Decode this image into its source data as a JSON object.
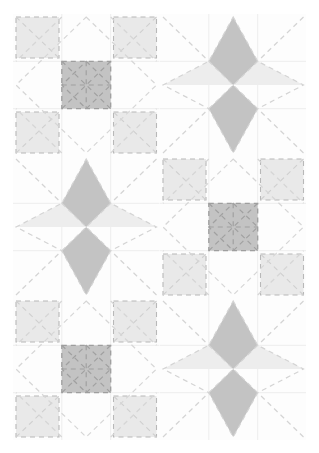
{
  "artwork": {
    "title": "Patchwork Quilt Layout",
    "type": "quilt-pattern",
    "canvas": {
      "width": 319,
      "height": 453
    },
    "surface": {
      "x": 13,
      "y": 14,
      "width": 293,
      "height": 426
    },
    "grid": {
      "columns": 2,
      "rows": 3,
      "block_width": 146.5,
      "block_height": 142
    }
  },
  "palette": {
    "background": "#ffffff",
    "block_background": "#fdfdfd",
    "medium_gray": "#c3c3c3",
    "light_gray": "#ebebeb",
    "pale_gray": "#f0f0f0",
    "seam_line": "#e3e3e3",
    "quilting_stitch": "#c9c9c9",
    "stitch_dark": "#b0b0b0",
    "patch_outline": "#b8b8b8"
  },
  "blocks": [
    {
      "index": 0,
      "name": "square-in-square-block",
      "row": 0,
      "col": 0,
      "pattern": "square-in-square",
      "center_fill": "#c3c3c3",
      "corner_fill": "#e9e9e9"
    },
    {
      "index": 1,
      "name": "four-point-star-block",
      "row": 0,
      "col": 1,
      "pattern": "four-point-star",
      "point_fill": "#c3c3c3",
      "wing_fill": "#ededed"
    },
    {
      "index": 2,
      "name": "four-point-star-block",
      "row": 1,
      "col": 0,
      "pattern": "four-point-star",
      "point_fill": "#c3c3c3",
      "wing_fill": "#ededed"
    },
    {
      "index": 3,
      "name": "square-in-square-block",
      "row": 1,
      "col": 1,
      "pattern": "square-in-square",
      "center_fill": "#c3c3c3",
      "corner_fill": "#e9e9e9"
    },
    {
      "index": 4,
      "name": "square-in-square-block",
      "row": 2,
      "col": 0,
      "pattern": "square-in-square",
      "center_fill": "#c3c3c3",
      "corner_fill": "#e9e9e9"
    },
    {
      "index": 5,
      "name": "four-point-star-block",
      "row": 2,
      "col": 1,
      "pattern": "four-point-star",
      "point_fill": "#c3c3c3",
      "wing_fill": "#ededed"
    }
  ],
  "quilting": {
    "style": "dashed-stitch",
    "dash_pattern": "5 4",
    "stitch_width": 1.2,
    "motifs": [
      "on-point-diamond",
      "corner-diagonals",
      "center-cross"
    ]
  }
}
